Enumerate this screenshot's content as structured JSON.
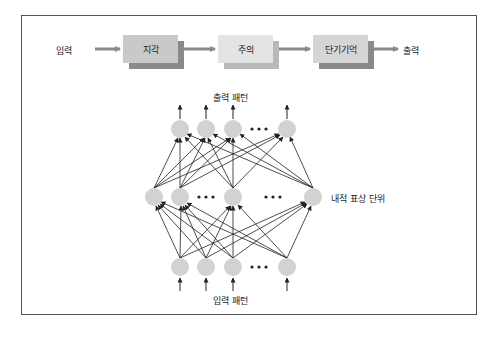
{
  "flow": {
    "input_label": "입력",
    "stages": [
      {
        "label": "지각",
        "color": "#c9c9c9",
        "shadow": "#8c8c8c"
      },
      {
        "label": "주의",
        "color": "#e4e4e4",
        "shadow": "#b8b8b8"
      },
      {
        "label": "단기기억",
        "color": "#d5d5d5",
        "shadow": "#8c8c8c"
      }
    ],
    "output_label": "출력",
    "arrow_color": "#8a8a8a"
  },
  "network": {
    "output_pattern_label": "출력 패턴",
    "hidden_layer_label": "내적 표상 단위",
    "input_pattern_label": "입력 패턴",
    "ellipsis": "• • •",
    "node_color": "#d2d2d2",
    "edge_color": "#222222"
  }
}
